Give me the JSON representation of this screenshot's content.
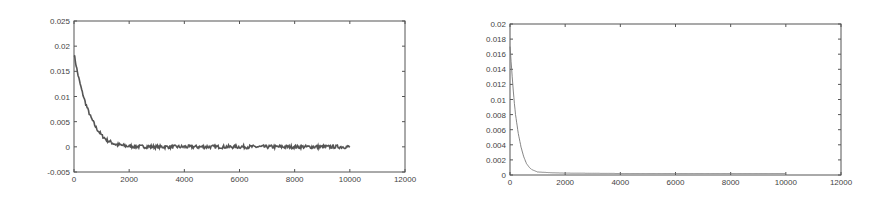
{
  "chart_data": [
    {
      "type": "line",
      "title": "",
      "xlabel": "",
      "ylabel": "",
      "xlim": [
        0,
        12000
      ],
      "ylim": [
        -0.005,
        0.025
      ],
      "grid": false,
      "xticks": [
        0,
        2000,
        4000,
        6000,
        8000,
        10000,
        12000
      ],
      "xtick_labels": [
        "0",
        "2000",
        "4000",
        "6000",
        "8000",
        "10000",
        "12000"
      ],
      "yticks": [
        -0.005,
        0,
        0.005,
        0.01,
        0.015,
        0.02,
        0.025
      ],
      "ytick_labels": [
        "-0.005",
        "0",
        "0.005",
        "0.01",
        "0.015",
        "0.02",
        "0.025"
      ],
      "series": [
        {
          "name": "noisy decay",
          "color": "#555555",
          "noisy": true,
          "x": [
            0,
            100,
            200,
            300,
            400,
            500,
            600,
            800,
            1000,
            1200,
            1500,
            2000,
            3000,
            4000,
            6000,
            8000,
            10000
          ],
          "values": [
            0.0185,
            0.0155,
            0.013,
            0.0108,
            0.009,
            0.0074,
            0.006,
            0.0038,
            0.0023,
            0.0013,
            0.0005,
            0.0001,
            0.0,
            0.0,
            0.0,
            0.0,
            0.0
          ]
        }
      ],
      "frame": {
        "left": 74,
        "top": 21,
        "right": 405,
        "bottom": 172
      }
    },
    {
      "type": "line",
      "title": "",
      "xlabel": "",
      "ylabel": "",
      "xlim": [
        0,
        12000
      ],
      "ylim": [
        0,
        0.02
      ],
      "grid": false,
      "xticks": [
        0,
        2000,
        4000,
        6000,
        8000,
        10000,
        12000
      ],
      "xtick_labels": [
        "0",
        "2000",
        "4000",
        "6000",
        "8000",
        "10000",
        "12000"
      ],
      "yticks": [
        0,
        0.002,
        0.004,
        0.006,
        0.008,
        0.01,
        0.012,
        0.014,
        0.016,
        0.018,
        0.02
      ],
      "ytick_labels": [
        "0",
        "0.002",
        "0.004",
        "0.006",
        "0.008",
        "0.01",
        "0.012",
        "0.014",
        "0.016",
        "0.018",
        "0.02"
      ],
      "series": [
        {
          "name": "smooth decay",
          "color": "#777777",
          "noisy": false,
          "x": [
            0,
            50,
            100,
            150,
            200,
            300,
            400,
            500,
            600,
            700,
            800,
            1000,
            1500,
            2000,
            4000,
            6000,
            8000,
            10000
          ],
          "values": [
            0.017,
            0.0145,
            0.012,
            0.0098,
            0.008,
            0.0055,
            0.0037,
            0.0024,
            0.0015,
            0.001,
            0.0007,
            0.0004,
            0.0003,
            0.00025,
            0.0002,
            0.0002,
            0.0002,
            0.0002
          ]
        }
      ],
      "frame": {
        "left": 510,
        "top": 24,
        "right": 841,
        "bottom": 175
      }
    }
  ]
}
